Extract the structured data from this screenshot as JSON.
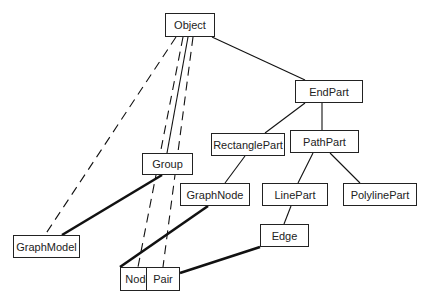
{
  "diagram": {
    "nodes": [
      {
        "id": "object",
        "label": "Object",
        "x": 165,
        "y": 13,
        "w": 50,
        "h": 24
      },
      {
        "id": "endpart",
        "label": "EndPart",
        "x": 295,
        "y": 80,
        "w": 68,
        "h": 23
      },
      {
        "id": "rectanglepart",
        "label": "RectanglePart",
        "x": 211,
        "y": 133,
        "w": 74,
        "h": 23
      },
      {
        "id": "pathpart",
        "label": "PathPart",
        "x": 290,
        "y": 130,
        "w": 69,
        "h": 23
      },
      {
        "id": "group",
        "label": "Group",
        "x": 142,
        "y": 153,
        "w": 51,
        "h": 22
      },
      {
        "id": "graphnode",
        "label": "GraphNode",
        "x": 180,
        "y": 183,
        "w": 70,
        "h": 23
      },
      {
        "id": "linepart",
        "label": "LinePart",
        "x": 262,
        "y": 183,
        "w": 66,
        "h": 23
      },
      {
        "id": "polylinepart",
        "label": "PolylinePart",
        "x": 343,
        "y": 183,
        "w": 74,
        "h": 23
      },
      {
        "id": "graphmodel",
        "label": "GraphModel",
        "x": 13,
        "y": 235,
        "w": 67,
        "h": 23
      },
      {
        "id": "edge",
        "label": "Edge",
        "x": 260,
        "y": 224,
        "w": 49,
        "h": 23
      },
      {
        "id": "node",
        "label": "Node",
        "x": 120,
        "y": 267,
        "w": 37,
        "h": 24
      },
      {
        "id": "pair",
        "label": "Pair",
        "x": 146,
        "y": 267,
        "w": 34,
        "h": 24
      }
    ],
    "edges": [
      {
        "from": "object",
        "to": "endpart",
        "style": "solid-thin",
        "x1": 212,
        "y1": 37,
        "x2": 305,
        "y2": 80
      },
      {
        "from": "endpart",
        "to": "rectanglepart",
        "style": "solid-thin",
        "x1": 305,
        "y1": 103,
        "x2": 265,
        "y2": 133
      },
      {
        "from": "endpart",
        "to": "pathpart",
        "style": "solid-thin",
        "x1": 322,
        "y1": 103,
        "x2": 322,
        "y2": 130
      },
      {
        "from": "rectanglepart",
        "to": "graphnode",
        "style": "solid-thin",
        "x1": 245,
        "y1": 156,
        "x2": 225,
        "y2": 183
      },
      {
        "from": "pathpart",
        "to": "linepart",
        "style": "solid-thin",
        "x1": 313,
        "y1": 153,
        "x2": 298,
        "y2": 183
      },
      {
        "from": "pathpart",
        "to": "polylinepart",
        "style": "solid-thin",
        "x1": 330,
        "y1": 153,
        "x2": 360,
        "y2": 183
      },
      {
        "from": "linepart",
        "to": "edge",
        "style": "solid-thin",
        "x1": 291,
        "y1": 206,
        "x2": 284,
        "y2": 224
      },
      {
        "from": "object",
        "to": "graphmodel",
        "style": "dashed",
        "x1": 176,
        "y1": 37,
        "x2": 45,
        "y2": 235
      },
      {
        "from": "object",
        "to": "node",
        "style": "dashed",
        "x1": 183,
        "y1": 37,
        "x2": 138,
        "y2": 267
      },
      {
        "from": "object",
        "to": "group",
        "style": "solid-thin",
        "x1": 188,
        "y1": 37,
        "x2": 167,
        "y2": 153
      },
      {
        "from": "object",
        "to": "pair",
        "style": "dashed",
        "x1": 193,
        "y1": 37,
        "x2": 163,
        "y2": 267
      },
      {
        "from": "group",
        "to": "graphmodel",
        "style": "solid-thick",
        "x1": 162,
        "y1": 175,
        "x2": 62,
        "y2": 235
      },
      {
        "from": "graphnode",
        "to": "node",
        "style": "solid-thick",
        "x1": 208,
        "y1": 206,
        "x2": 120,
        "y2": 267
      },
      {
        "from": "edge",
        "to": "pair",
        "style": "solid-thick",
        "x1": 260,
        "y1": 247,
        "x2": 180,
        "y2": 273
      }
    ]
  }
}
